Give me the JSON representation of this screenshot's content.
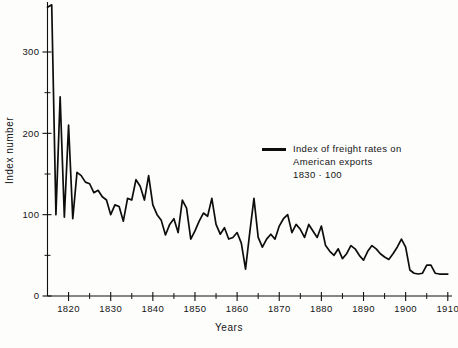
{
  "figure": {
    "background": "#fdfdfc",
    "line_color": "#0d0d0d",
    "axis_color": "#111111"
  },
  "axes": {
    "xlabel": "Years",
    "ylabel": "Index number",
    "x_ticks": [
      "1820",
      "1830",
      "1840",
      "1850",
      "1860",
      "1870",
      "1880",
      "1890",
      "1900",
      "1910"
    ],
    "y_ticks": [
      "0",
      "100",
      "200",
      "300"
    ]
  },
  "legend": {
    "line1": "Index of freight rates on",
    "line2": "American exports",
    "line3": "1830 · 100"
  },
  "chart_data": {
    "type": "line",
    "title": "",
    "subtitle": "",
    "xlabel": "Years",
    "ylabel": "Index number",
    "xlim": [
      1815,
      1911
    ],
    "ylim": [
      0,
      360
    ],
    "grid": false,
    "legend_position": "center-right",
    "x_major_ticks": [
      1820,
      1830,
      1840,
      1850,
      1860,
      1870,
      1880,
      1890,
      1900,
      1910
    ],
    "x_minor_ticks": [
      1825,
      1835,
      1845,
      1855,
      1865,
      1875,
      1885,
      1895,
      1905
    ],
    "y_major_ticks": [
      0,
      100,
      200,
      300
    ],
    "y_minor_ticks": [
      50,
      150,
      250
    ],
    "annotations": [
      "1830 = 100 base year"
    ],
    "series": [
      {
        "name": "Index of freight rates on American exports (1830 = 100)",
        "color": "#0d0d0d",
        "x": [
          1815,
          1816,
          1817,
          1818,
          1819,
          1820,
          1821,
          1822,
          1823,
          1824,
          1825,
          1826,
          1827,
          1828,
          1829,
          1830,
          1831,
          1832,
          1833,
          1834,
          1835,
          1836,
          1837,
          1838,
          1839,
          1840,
          1841,
          1842,
          1843,
          1844,
          1845,
          1846,
          1847,
          1848,
          1849,
          1850,
          1851,
          1852,
          1853,
          1854,
          1855,
          1856,
          1857,
          1858,
          1859,
          1860,
          1861,
          1862,
          1863,
          1864,
          1865,
          1866,
          1867,
          1868,
          1869,
          1870,
          1871,
          1872,
          1873,
          1874,
          1875,
          1876,
          1877,
          1878,
          1879,
          1880,
          1881,
          1882,
          1883,
          1884,
          1885,
          1886,
          1887,
          1888,
          1889,
          1890,
          1891,
          1892,
          1893,
          1894,
          1895,
          1896,
          1897,
          1898,
          1899,
          1900,
          1901,
          1902,
          1903,
          1904,
          1905,
          1906,
          1907,
          1908,
          1909,
          1910
        ],
        "y": [
          355,
          358,
          100,
          245,
          97,
          210,
          95,
          152,
          148,
          140,
          138,
          127,
          130,
          122,
          118,
          100,
          112,
          110,
          92,
          120,
          118,
          143,
          135,
          118,
          148,
          112,
          100,
          93,
          75,
          88,
          95,
          78,
          118,
          108,
          70,
          80,
          92,
          102,
          98,
          120,
          88,
          76,
          84,
          70,
          72,
          78,
          65,
          33,
          78,
          120,
          72,
          60,
          70,
          76,
          70,
          86,
          95,
          100,
          78,
          88,
          82,
          72,
          88,
          80,
          72,
          86,
          62,
          55,
          50,
          58,
          46,
          52,
          62,
          58,
          50,
          44,
          55,
          62,
          58,
          52,
          48,
          45,
          52,
          60,
          70,
          60,
          32,
          28,
          27,
          28,
          38,
          38,
          28,
          27,
          27,
          27
        ]
      }
    ]
  }
}
